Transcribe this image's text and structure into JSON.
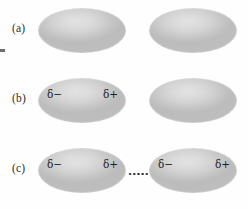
{
  "figure": {
    "background_color": "#fefefe",
    "molecule_fill_light": "#e2e2e2",
    "molecule_fill_dark": "#bcbcbc",
    "label_color": "#2e2e2e",
    "charge_color": "#1d1d1d"
  },
  "panels": [
    {
      "label": "(a)",
      "caption": "two nonpolar molecules, no charge separation",
      "molecules": [
        {
          "name": "left-molecule",
          "charges": []
        },
        {
          "name": "right-molecule",
          "charges": []
        }
      ]
    },
    {
      "label": "(b)",
      "caption": "instantaneous dipole on left molecule",
      "molecules": [
        {
          "name": "left-molecule",
          "charges": [
            {
              "symbol": "δ",
              "sign": "−",
              "text": "δ−"
            },
            {
              "symbol": "δ",
              "sign": "+",
              "text": "δ+"
            }
          ]
        },
        {
          "name": "right-molecule",
          "charges": []
        }
      ]
    },
    {
      "label": "(c)",
      "caption": "induced dipole on right molecule, attraction shown by dotted line",
      "molecules": [
        {
          "name": "left-molecule",
          "charges": [
            {
              "symbol": "δ",
              "sign": "−",
              "text": "δ−"
            },
            {
              "symbol": "δ",
              "sign": "+",
              "text": "δ+"
            }
          ]
        },
        {
          "name": "right-molecule",
          "charges": [
            {
              "symbol": "δ",
              "sign": "−",
              "text": "δ−"
            },
            {
              "symbol": "δ",
              "sign": "+",
              "text": "δ+"
            }
          ]
        }
      ],
      "connector": {
        "name": "dotted-attraction-line",
        "style": "dotted"
      }
    }
  ],
  "charges": {
    "delta_minus": "δ−",
    "delta_plus": "δ+"
  }
}
